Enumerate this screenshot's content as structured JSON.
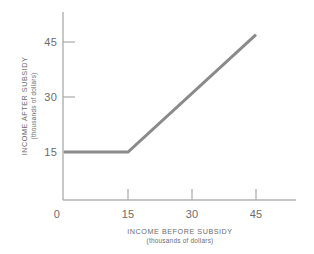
{
  "chart_data": {
    "type": "line",
    "title": "",
    "xlabel": "INCOME BEFORE SUBSIDY",
    "xlabel_sub": "(thousands of dollars)",
    "ylabel": "INCOME AFTER SUBSIDY",
    "ylabel_sub": "(thousands of dollars)",
    "xlim": [
      0,
      52
    ],
    "ylim": [
      0,
      52
    ],
    "xticks": [
      0,
      15,
      30,
      45
    ],
    "yticks": [
      15,
      30,
      45
    ],
    "xtick_labels": [
      "0",
      "15",
      "30",
      "45"
    ],
    "ytick_labels": [
      "15",
      "30",
      "45"
    ],
    "grid": false,
    "legend": false,
    "series": [
      {
        "name": "Income after subsidy",
        "color": "#8a8a8a",
        "x": [
          0,
          15,
          45
        ],
        "values": [
          15,
          15,
          47
        ]
      }
    ],
    "annotations": []
  },
  "axis": {
    "color": "#b0b0b0",
    "tick_color": "#a8a8a8"
  }
}
